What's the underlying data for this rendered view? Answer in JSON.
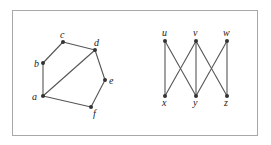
{
  "graphs": [
    {
      "name": "left-graph",
      "nodes": [
        {
          "id": "a",
          "x": 43,
          "y": 96,
          "lx": 32,
          "ly": 100
        },
        {
          "id": "b",
          "x": 43,
          "y": 63,
          "lx": 34,
          "ly": 67
        },
        {
          "id": "c",
          "x": 63,
          "y": 42,
          "lx": 60,
          "ly": 38
        },
        {
          "id": "d",
          "x": 95,
          "y": 50,
          "lx": 94,
          "ly": 46
        },
        {
          "id": "e",
          "x": 105,
          "y": 80,
          "lx": 109,
          "ly": 84
        },
        {
          "id": "f",
          "x": 91,
          "y": 107,
          "lx": 93,
          "ly": 117
        }
      ],
      "edges": [
        [
          "a",
          "b"
        ],
        [
          "b",
          "c"
        ],
        [
          "c",
          "d"
        ],
        [
          "d",
          "e"
        ],
        [
          "e",
          "f"
        ],
        [
          "f",
          "a"
        ],
        [
          "a",
          "d"
        ]
      ]
    },
    {
      "name": "right-graph",
      "nodes": [
        {
          "id": "u",
          "x": 165,
          "y": 41,
          "lx": 162,
          "ly": 36
        },
        {
          "id": "v",
          "x": 196,
          "y": 41,
          "lx": 193,
          "ly": 36
        },
        {
          "id": "w",
          "x": 227,
          "y": 41,
          "lx": 223,
          "ly": 36
        },
        {
          "id": "x",
          "x": 165,
          "y": 96,
          "lx": 162,
          "ly": 106
        },
        {
          "id": "y",
          "x": 196,
          "y": 96,
          "lx": 193,
          "ly": 106
        },
        {
          "id": "z",
          "x": 227,
          "y": 96,
          "lx": 224,
          "ly": 106
        }
      ],
      "edges": [
        [
          "u",
          "x"
        ],
        [
          "u",
          "y"
        ],
        [
          "v",
          "x"
        ],
        [
          "v",
          "y"
        ],
        [
          "v",
          "z"
        ],
        [
          "w",
          "y"
        ],
        [
          "w",
          "z"
        ]
      ]
    }
  ]
}
